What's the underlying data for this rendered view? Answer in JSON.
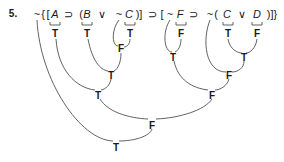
{
  "problem": {
    "number": "5.",
    "formula_tokens": [
      {
        "text": "~",
        "x": 37,
        "kind": "op"
      },
      {
        "text": "{",
        "x": 43,
        "kind": "op"
      },
      {
        "text": "[",
        "x": 48,
        "kind": "op"
      },
      {
        "text": "A",
        "x": 55,
        "kind": "var"
      },
      {
        "text": "⊃",
        "x": 68,
        "kind": "op"
      },
      {
        "text": "(",
        "x": 81,
        "kind": "op"
      },
      {
        "text": "B",
        "x": 87,
        "kind": "var"
      },
      {
        "text": "∨",
        "x": 102,
        "kind": "op"
      },
      {
        "text": "~",
        "x": 119,
        "kind": "op"
      },
      {
        "text": "C",
        "x": 129,
        "kind": "var"
      },
      {
        "text": ")]",
        "x": 139,
        "kind": "op"
      },
      {
        "text": "⊃",
        "x": 152,
        "kind": "op"
      },
      {
        "text": "[",
        "x": 162,
        "kind": "op"
      },
      {
        "text": "~",
        "x": 170,
        "kind": "op"
      },
      {
        "text": "F",
        "x": 180,
        "kind": "var"
      },
      {
        "text": "⊃",
        "x": 193,
        "kind": "op"
      },
      {
        "text": "~",
        "x": 210,
        "kind": "op"
      },
      {
        "text": "(",
        "x": 216,
        "kind": "op"
      },
      {
        "text": "C",
        "x": 227,
        "kind": "var"
      },
      {
        "text": "∨",
        "x": 242,
        "kind": "op"
      },
      {
        "text": "D",
        "x": 257,
        "kind": "var"
      },
      {
        "text": ")]}",
        "x": 272,
        "kind": "op"
      }
    ],
    "truth_values": [
      {
        "id": "A",
        "value": "T",
        "x": 55,
        "y": 33
      },
      {
        "id": "B",
        "value": "T",
        "x": 87,
        "y": 33
      },
      {
        "id": "C1",
        "value": "T",
        "x": 130,
        "y": 33
      },
      {
        "id": "F",
        "value": "F",
        "x": 181,
        "y": 33
      },
      {
        "id": "C2",
        "value": "T",
        "x": 228,
        "y": 33
      },
      {
        "id": "D",
        "value": "F",
        "x": 257,
        "y": 33
      },
      {
        "id": "not-C",
        "value": "F",
        "x": 121,
        "y": 48
      },
      {
        "id": "not-F",
        "value": "T",
        "x": 173,
        "y": 57
      },
      {
        "id": "C-or-D",
        "value": "T",
        "x": 244,
        "y": 57
      },
      {
        "id": "B-or-not-C",
        "value": "T",
        "x": 111,
        "y": 75
      },
      {
        "id": "not-C-or-D",
        "value": "F",
        "x": 229,
        "y": 75
      },
      {
        "id": "A-implies-B-or-not-C",
        "value": "T",
        "x": 98,
        "y": 95
      },
      {
        "id": "not-F-implies-not-C-or-D",
        "value": "F",
        "x": 212,
        "y": 95
      },
      {
        "id": "main-implication",
        "value": "F",
        "x": 152,
        "y": 125
      },
      {
        "id": "negation-whole",
        "value": "T",
        "x": 116,
        "y": 147
      }
    ]
  }
}
